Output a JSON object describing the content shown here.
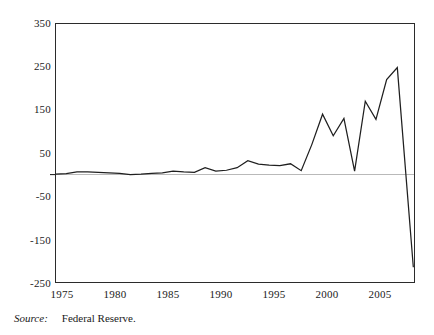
{
  "figure": {
    "source_label": "Source:",
    "source_value": "Federal Reserve."
  },
  "chart_data": {
    "type": "line",
    "title": "",
    "xlabel": "",
    "ylabel": "",
    "xlim": [
      1975,
      2008.6
    ],
    "ylim": [
      -250,
      350
    ],
    "grid": false,
    "zero_line": true,
    "legend": "none",
    "y_ticks": [
      350,
      250,
      150,
      50,
      -50,
      -150,
      -250
    ],
    "x_ticks": [
      1975,
      1980,
      1985,
      1990,
      1995,
      2000,
      2005
    ],
    "series": [
      {
        "name": "Federal Reserve series",
        "x": [
          1975,
          1976,
          1977,
          1978,
          1979,
          1980,
          1981,
          1982,
          1983,
          1984,
          1985,
          1986,
          1987,
          1988,
          1989,
          1990,
          1991,
          1992,
          1993,
          1994,
          1995,
          1996,
          1997,
          1998,
          1999,
          2000,
          2001,
          2002,
          2003,
          2004,
          2005,
          2006,
          2007,
          2008.5
        ],
        "values": [
          1,
          2,
          6,
          6,
          5,
          4,
          3,
          0,
          1,
          3,
          4,
          8,
          6,
          5,
          16,
          8,
          10,
          16,
          32,
          24,
          22,
          21,
          25,
          9,
          70,
          140,
          90,
          130,
          8,
          170,
          128,
          220,
          248,
          -215
        ]
      }
    ]
  }
}
